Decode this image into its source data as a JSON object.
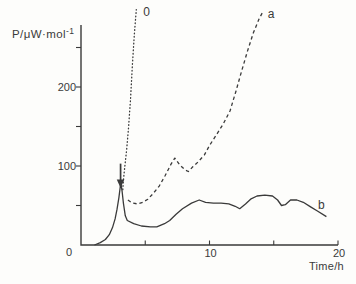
{
  "figure": {
    "background": "#fdfdfb",
    "ink_color": "#3a3a3a"
  },
  "chart_data": {
    "type": "line",
    "title": "",
    "xlabel": "Time/h",
    "ylabel": "P/μW·mol",
    "ylabel_superscript": "-1",
    "x_range": [
      0,
      20
    ],
    "y_range": [
      0,
      280
    ],
    "grid": false,
    "legend_position": "inline-curve-labels",
    "x_ticks": [
      5,
      10,
      15,
      20
    ],
    "x_tick_labels": [
      {
        "value": 10,
        "label": "10"
      },
      {
        "value": 20,
        "label": "20"
      }
    ],
    "origin_label": "0",
    "y_ticks": [
      50,
      100,
      150,
      200,
      250
    ],
    "y_tick_labels": [
      {
        "value": 100,
        "label": "100"
      },
      {
        "value": 200,
        "label": "200"
      }
    ],
    "series": [
      {
        "name": "0",
        "style": "dotted",
        "label_at": [
          5.1,
          295
        ],
        "points": [
          [
            3.25,
            70
          ],
          [
            3.3,
            82
          ],
          [
            3.4,
            98
          ],
          [
            3.55,
            120
          ],
          [
            3.7,
            148
          ],
          [
            3.85,
            184
          ],
          [
            4.0,
            228
          ],
          [
            4.15,
            266
          ],
          [
            4.3,
            298
          ]
        ]
      },
      {
        "name": "a",
        "style": "dashed",
        "label_at": [
          14.8,
          292
        ],
        "points": [
          [
            3.65,
            57
          ],
          [
            4.0,
            53
          ],
          [
            4.4,
            52
          ],
          [
            4.8,
            54
          ],
          [
            5.2,
            58
          ],
          [
            5.6,
            65
          ],
          [
            6.1,
            75
          ],
          [
            6.55,
            88
          ],
          [
            7.0,
            102
          ],
          [
            7.3,
            110
          ],
          [
            7.7,
            101
          ],
          [
            8.1,
            95
          ],
          [
            8.35,
            93
          ],
          [
            8.7,
            99
          ],
          [
            9.1,
            105
          ],
          [
            9.6,
            114
          ],
          [
            10.0,
            126
          ],
          [
            10.6,
            141
          ],
          [
            11.1,
            154
          ],
          [
            11.6,
            170
          ],
          [
            12.05,
            194
          ],
          [
            12.5,
            220
          ],
          [
            12.95,
            245
          ],
          [
            13.4,
            268
          ],
          [
            13.85,
            286
          ],
          [
            14.15,
            295
          ]
        ]
      },
      {
        "name": "b",
        "style": "solid",
        "label_at": [
          18.7,
          51
        ],
        "points": [
          [
            1.05,
            0
          ],
          [
            1.5,
            3
          ],
          [
            1.9,
            7
          ],
          [
            2.2,
            13
          ],
          [
            2.45,
            22
          ],
          [
            2.65,
            33
          ],
          [
            2.8,
            45
          ],
          [
            2.95,
            60
          ],
          [
            3.1,
            79
          ],
          [
            3.2,
            68
          ],
          [
            3.3,
            53
          ],
          [
            3.45,
            37
          ],
          [
            3.6,
            31
          ],
          [
            4.1,
            27
          ],
          [
            4.7,
            24
          ],
          [
            5.4,
            23
          ],
          [
            5.9,
            23
          ],
          [
            6.5,
            27
          ],
          [
            6.9,
            31
          ],
          [
            7.4,
            39
          ],
          [
            7.9,
            46
          ],
          [
            8.6,
            53
          ],
          [
            9.2,
            57
          ],
          [
            9.7,
            54
          ],
          [
            10.3,
            53
          ],
          [
            10.9,
            53
          ],
          [
            11.5,
            52
          ],
          [
            12.0,
            49
          ],
          [
            12.35,
            46
          ],
          [
            12.8,
            52
          ],
          [
            13.2,
            58
          ],
          [
            13.7,
            62
          ],
          [
            14.3,
            63
          ],
          [
            14.9,
            62
          ],
          [
            15.3,
            57
          ],
          [
            15.6,
            50
          ],
          [
            15.9,
            51
          ],
          [
            16.3,
            57
          ],
          [
            16.8,
            57
          ],
          [
            17.3,
            54
          ],
          [
            17.9,
            48
          ],
          [
            18.4,
            43
          ],
          [
            19.1,
            36
          ]
        ]
      }
    ],
    "annotations": [
      {
        "type": "arrow-down",
        "x": 3.08,
        "y_from": 103,
        "y_to": 72
      }
    ]
  }
}
